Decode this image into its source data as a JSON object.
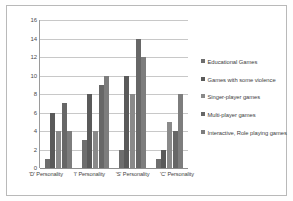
{
  "chart_data": {
    "type": "bar",
    "title": "",
    "xlabel": "",
    "ylabel": "",
    "ylim": [
      0,
      16
    ],
    "yticks": [
      0,
      2,
      4,
      6,
      8,
      10,
      12,
      14,
      16
    ],
    "grid": true,
    "legend_position": "right",
    "categories": [
      "'D' Personality",
      "'I' Personality",
      "'S' Personality",
      "'C' Personality"
    ],
    "series": [
      {
        "name": "Educational Games",
        "color": "#6e6e6e",
        "values": [
          1,
          3,
          2,
          1
        ]
      },
      {
        "name": "Games with some violence",
        "color": "#5a5a5a",
        "values": [
          6,
          8,
          10,
          2
        ]
      },
      {
        "name": "Singer-player games",
        "color": "#8a8a8a",
        "values": [
          4,
          4,
          8,
          5
        ]
      },
      {
        "name": "Multi-player games",
        "color": "#676767",
        "values": [
          7,
          9,
          14,
          4
        ]
      },
      {
        "name": "Interactive, Role playing games",
        "color": "#7d7d7d",
        "values": [
          4,
          10,
          12,
          8
        ]
      }
    ]
  },
  "axis": {
    "y_tick_0": "0",
    "y_tick_1": "2",
    "y_tick_2": "4",
    "y_tick_3": "6",
    "y_tick_4": "8",
    "y_tick_5": "10",
    "y_tick_6": "12",
    "y_tick_7": "14",
    "y_tick_8": "16"
  }
}
